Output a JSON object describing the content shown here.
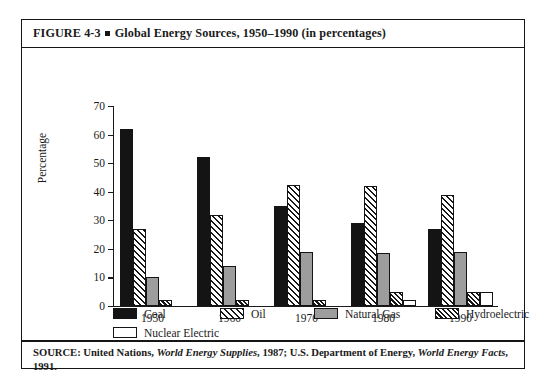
{
  "figure": {
    "label": "FIGURE 4-3",
    "title": "Global Energy Sources, 1950–1990 (in percentages)",
    "bullet_icon": "square-bullet-icon"
  },
  "source": {
    "prefix": "SOURCE: United Nations,",
    "work1": "World Energy Supplies",
    "mid": ", 1987; U.S. Department of Energy,",
    "work2": "World Energy Facts",
    "suffix": ", 1991."
  },
  "legend": {
    "row1": [
      {
        "label": "Coal",
        "swatch": "solid-black"
      },
      {
        "label": "Oil",
        "swatch": "hatch-oil"
      },
      {
        "label": "Natural Gas",
        "swatch": "gray"
      },
      {
        "label": "Hydroelectric",
        "swatch": "hatch-hydro"
      }
    ],
    "row2": [
      {
        "label": "Nuclear Electric",
        "swatch": "white"
      }
    ]
  },
  "chart_data": {
    "type": "bar",
    "title": "Global Energy Sources, 1950–1990 (in percentages)",
    "xlabel": "",
    "ylabel": "Percentage",
    "ylim": [
      0,
      70
    ],
    "yticks": [
      0,
      10,
      20,
      30,
      40,
      50,
      60,
      70
    ],
    "ytick_labels": [
      "0",
      "10",
      "20",
      "30",
      "40",
      "50",
      "60",
      "70"
    ],
    "grid": false,
    "legend_position": "below-axes",
    "categories": [
      "1950",
      "1960",
      "1970",
      "1980",
      "1990"
    ],
    "series": [
      {
        "name": "Coal",
        "values": [
          62,
          52,
          35,
          29,
          27
        ]
      },
      {
        "name": "Oil",
        "values": [
          27,
          32,
          42.5,
          42,
          39
        ]
      },
      {
        "name": "Natural Gas",
        "values": [
          10,
          14,
          19,
          18.5,
          19
        ]
      },
      {
        "name": "Hydroelectric",
        "values": [
          2,
          2,
          2,
          5,
          5
        ]
      },
      {
        "name": "Nuclear Electric",
        "values": [
          0,
          0,
          0,
          2,
          5
        ]
      }
    ]
  }
}
